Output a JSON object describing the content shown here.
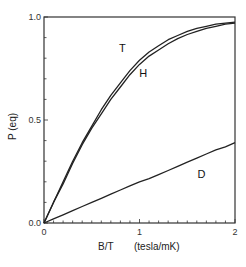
{
  "chart_data": {
    "type": "line",
    "title": "",
    "xlabel": "B/T     (tesla/mK)",
    "ylabel": "P (eq)",
    "xlim": [
      0,
      2
    ],
    "ylim": [
      0,
      1
    ],
    "x_ticks": [
      "0",
      "1",
      "2"
    ],
    "y_ticks": [
      "0.0",
      "0.5",
      "1.0"
    ],
    "grid": false,
    "legend": "inline labels",
    "x": [
      0,
      0.1,
      0.2,
      0.3,
      0.4,
      0.5,
      0.6,
      0.7,
      0.8,
      0.9,
      1.0,
      1.1,
      1.2,
      1.3,
      1.4,
      1.5,
      1.6,
      1.7,
      1.8,
      1.9,
      2.0
    ],
    "series": [
      {
        "name": "T",
        "values": [
          0,
          0.1,
          0.2,
          0.3,
          0.39,
          0.47,
          0.55,
          0.62,
          0.68,
          0.74,
          0.79,
          0.83,
          0.86,
          0.89,
          0.91,
          0.93,
          0.945,
          0.955,
          0.965,
          0.97,
          0.975
        ]
      },
      {
        "name": "H",
        "values": [
          0,
          0.1,
          0.19,
          0.29,
          0.38,
          0.46,
          0.53,
          0.6,
          0.66,
          0.72,
          0.77,
          0.81,
          0.84,
          0.87,
          0.895,
          0.915,
          0.93,
          0.945,
          0.955,
          0.965,
          0.97
        ]
      },
      {
        "name": "D",
        "values": [
          0,
          0.02,
          0.04,
          0.06,
          0.08,
          0.1,
          0.12,
          0.14,
          0.16,
          0.18,
          0.2,
          0.215,
          0.235,
          0.255,
          0.275,
          0.295,
          0.315,
          0.335,
          0.355,
          0.37,
          0.39
        ]
      }
    ],
    "annotations": [
      {
        "text": "T",
        "x": 0.82,
        "y": 0.83
      },
      {
        "text": "H",
        "x": 1.04,
        "y": 0.71
      },
      {
        "text": "D",
        "x": 1.65,
        "y": 0.22
      }
    ]
  },
  "labels": {
    "x_title_main": "B/T",
    "x_title_unit": "(tesla/mK)",
    "y_title": "P (eq)"
  }
}
